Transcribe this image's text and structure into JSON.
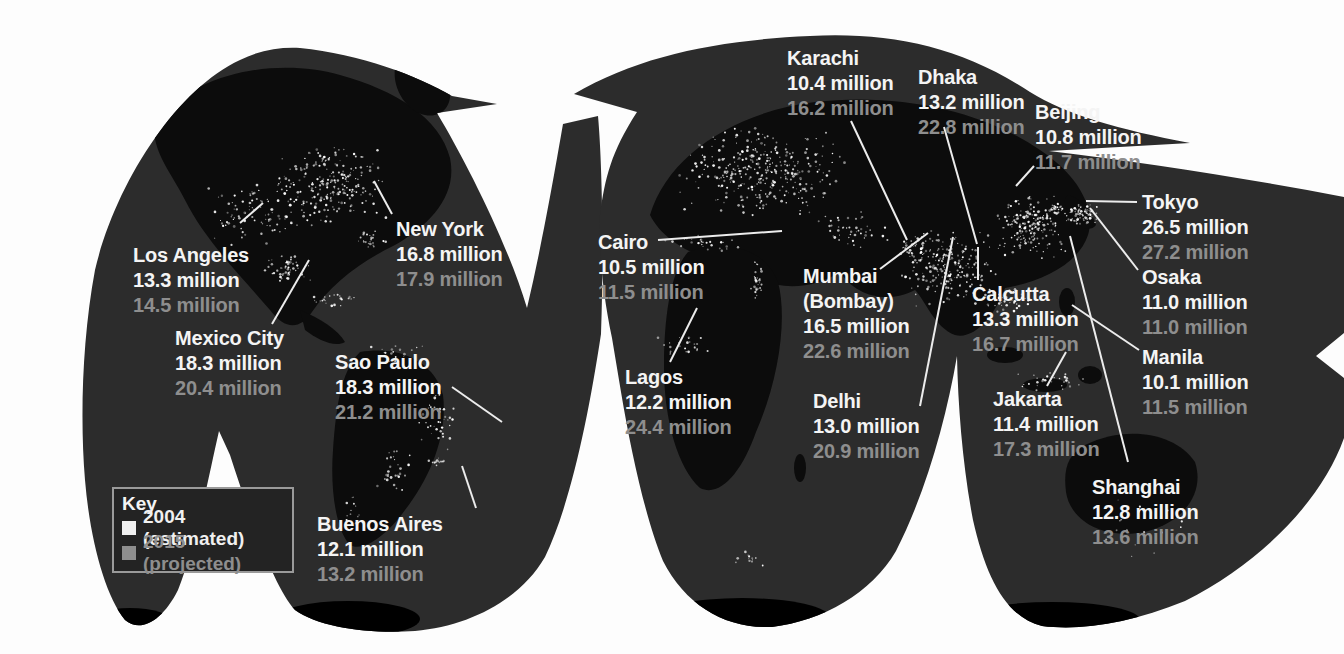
{
  "legend": {
    "title": "Key",
    "entries": [
      {
        "label": "2004 (estimated)",
        "type": "estimated"
      },
      {
        "label": "2015 (projected)",
        "type": "projected"
      }
    ]
  },
  "colors": {
    "estimated_text": "#f0f0f0",
    "projected_text": "#8e8e8e",
    "ocean": "#2c2c2c",
    "land": "#0c0c0c",
    "deep_land": "#000000",
    "background": "#fdfdfd",
    "leader_line": "#ececec",
    "city_light": "#ffffff"
  },
  "cities": [
    {
      "name": "Los Angeles",
      "pop2004": "13.3 million",
      "pop2015": "14.5 million",
      "x": 133,
      "y": 243,
      "leader": [
        263,
        203,
        240,
        223
      ]
    },
    {
      "name": "Mexico City",
      "pop2004": "18.3 million",
      "pop2015": "20.4 million",
      "x": 175,
      "y": 326,
      "leader": [
        309,
        260,
        272,
        324
      ]
    },
    {
      "name": "New York",
      "pop2004": "16.8 million",
      "pop2015": "17.9 million",
      "x": 396,
      "y": 217,
      "leader": [
        374,
        181,
        392,
        214
      ]
    },
    {
      "name": "Sao Paulo",
      "pop2004": "18.3 million",
      "pop2015": "21.2 million",
      "x": 335,
      "y": 350,
      "leader": [
        502,
        422,
        452,
        387
      ]
    },
    {
      "name": "Buenos Aires",
      "pop2004": "12.1 million",
      "pop2015": "13.2 million",
      "x": 317,
      "y": 512,
      "leader": [
        462,
        466,
        476,
        508
      ]
    },
    {
      "name": "Cairo",
      "pop2004": "10.5 million",
      "pop2015": "11.5 million",
      "x": 598,
      "y": 230,
      "leader": [
        782,
        231,
        658,
        240
      ]
    },
    {
      "name": "Lagos",
      "pop2004": "12.2 million",
      "pop2015": "24.4 million",
      "x": 625,
      "y": 365,
      "leader": [
        697,
        308,
        670,
        362
      ]
    },
    {
      "name": "Karachi",
      "pop2004": "10.4 million",
      "pop2015": "16.2 million",
      "x": 787,
      "y": 46,
      "leader": [
        907,
        240,
        851,
        121
      ]
    },
    {
      "name": "Mumbai",
      "name2": "(Bombay)",
      "pop2004": "16.5 million",
      "pop2015": "22.6 million",
      "x": 803,
      "y": 264,
      "leader": [
        928,
        233,
        880,
        269
      ]
    },
    {
      "name": "Delhi",
      "pop2004": "13.0 million",
      "pop2015": "20.9 million",
      "x": 813,
      "y": 389,
      "leader": [
        953,
        237,
        920,
        406
      ]
    },
    {
      "name": "Dhaka",
      "pop2004": "13.2 million",
      "pop2015": "22.8 million",
      "x": 918,
      "y": 65,
      "leader": [
        977,
        244,
        944,
        127
      ]
    },
    {
      "name": "Calcutta",
      "pop2004": "13.3 million",
      "pop2015": "16.7 million",
      "x": 972,
      "y": 282,
      "leader": [
        978,
        247,
        978,
        280
      ]
    },
    {
      "name": "Beijing",
      "pop2004": "10.8 million",
      "pop2015": "11.7 million",
      "x": 1035,
      "y": 100,
      "leader": [
        1016,
        186,
        1034,
        166
      ]
    },
    {
      "name": "Tokyo",
      "pop2004": "26.5 million",
      "pop2015": "27.2 million",
      "x": 1142,
      "y": 190,
      "leader": [
        1086,
        201,
        1137,
        202
      ]
    },
    {
      "name": "Osaka",
      "pop2004": "11.0 million",
      "pop2015": "11.0 million",
      "x": 1142,
      "y": 265,
      "leader": [
        1090,
        208,
        1138,
        270
      ]
    },
    {
      "name": "Manila",
      "pop2004": "10.1 million",
      "pop2015": "11.5 million",
      "x": 1142,
      "y": 345,
      "leader": [
        1072,
        305,
        1139,
        350
      ]
    },
    {
      "name": "Jakarta",
      "pop2004": "11.4 million",
      "pop2015": "17.3 million",
      "x": 993,
      "y": 387,
      "leader": [
        1066,
        352,
        1047,
        386
      ]
    },
    {
      "name": "Shanghai",
      "pop2004": "12.8 million",
      "pop2015": "13.6 million",
      "x": 1092,
      "y": 475,
      "leader": [
        1070,
        236,
        1128,
        462
      ]
    }
  ]
}
